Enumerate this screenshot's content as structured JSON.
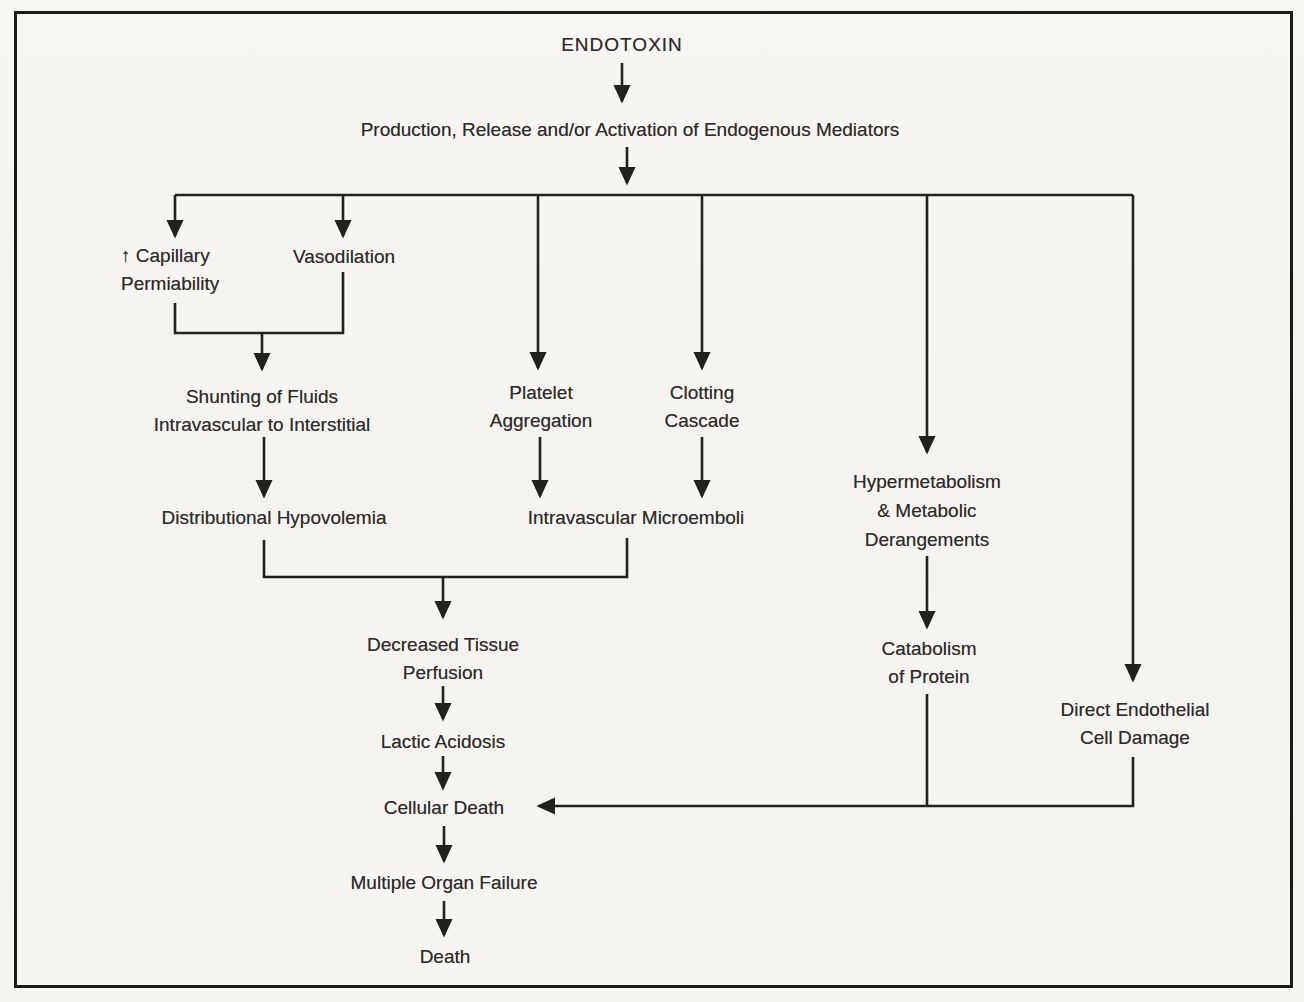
{
  "figure": {
    "colors": {
      "ink": "#232120",
      "paper": "#f6f5f2"
    },
    "nodes": {
      "endotoxin": {
        "label": "ENDOTOXIN"
      },
      "mediators": {
        "label": "Production, Release and/or Activation of Endogenous Mediators"
      },
      "capillary_permeability": {
        "lines": [
          "↑ Capillary",
          "Permiability"
        ]
      },
      "vasodilation": {
        "label": "Vasodilation"
      },
      "shunting": {
        "lines": [
          "Shunting of Fluids",
          "Intravascular to Interstitial"
        ]
      },
      "distributional_hypovolemia": {
        "label": "Distributional Hypovolemia"
      },
      "platelet_aggregation": {
        "lines": [
          "Platelet",
          "Aggregation"
        ]
      },
      "clotting_cascade": {
        "lines": [
          "Clotting",
          "Cascade"
        ]
      },
      "intravascular_microemboli": {
        "label": "Intravascular Microemboli"
      },
      "decreased_tissue_perfusion": {
        "lines": [
          "Decreased Tissue",
          "Perfusion"
        ]
      },
      "lactic_acidosis": {
        "label": "Lactic Acidosis"
      },
      "cellular_death": {
        "label": "Cellular Death"
      },
      "multiple_organ_failure": {
        "label": "Multiple Organ Failure"
      },
      "death": {
        "label": "Death"
      },
      "hypermetabolism": {
        "lines": [
          "Hypermetabolism",
          "& Metabolic",
          "Derangements"
        ]
      },
      "catabolism_of_protein": {
        "lines": [
          "Catabolism",
          "of Protein"
        ]
      },
      "direct_endothelial_cell_damage": {
        "lines": [
          "Direct Endothelial",
          "Cell Damage"
        ]
      }
    },
    "edges": [
      {
        "from": "endotoxin",
        "to": "mediators"
      },
      {
        "from": "mediators",
        "to": "capillary_permeability"
      },
      {
        "from": "mediators",
        "to": "vasodilation"
      },
      {
        "from": "mediators",
        "to": "platelet_aggregation"
      },
      {
        "from": "mediators",
        "to": "clotting_cascade"
      },
      {
        "from": "mediators",
        "to": "hypermetabolism"
      },
      {
        "from": "mediators",
        "to": "direct_endothelial_cell_damage"
      },
      {
        "from": "capillary_permeability",
        "to": "shunting"
      },
      {
        "from": "vasodilation",
        "to": "shunting"
      },
      {
        "from": "shunting",
        "to": "distributional_hypovolemia"
      },
      {
        "from": "platelet_aggregation",
        "to": "intravascular_microemboli"
      },
      {
        "from": "clotting_cascade",
        "to": "intravascular_microemboli"
      },
      {
        "from": "distributional_hypovolemia",
        "to": "decreased_tissue_perfusion"
      },
      {
        "from": "intravascular_microemboli",
        "to": "decreased_tissue_perfusion"
      },
      {
        "from": "decreased_tissue_perfusion",
        "to": "lactic_acidosis"
      },
      {
        "from": "lactic_acidosis",
        "to": "cellular_death"
      },
      {
        "from": "hypermetabolism",
        "to": "catabolism_of_protein"
      },
      {
        "from": "catabolism_of_protein",
        "to": "cellular_death"
      },
      {
        "from": "direct_endothelial_cell_damage",
        "to": "cellular_death"
      },
      {
        "from": "cellular_death",
        "to": "multiple_organ_failure"
      },
      {
        "from": "multiple_organ_failure",
        "to": "death"
      }
    ]
  }
}
